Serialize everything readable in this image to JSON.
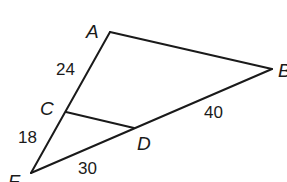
{
  "diagram": {
    "type": "geometry-triangle",
    "stroke_color": "#1a1a1a",
    "background": "#ffffff",
    "vertices": {
      "A": {
        "label": "A",
        "x": 110,
        "y": 32
      },
      "B": {
        "label": "B",
        "x": 272,
        "y": 69
      },
      "C": {
        "label": "C",
        "x": 66,
        "y": 112
      },
      "D": {
        "label": "D",
        "x": 134,
        "y": 128
      },
      "F": {
        "label": "F",
        "x": 31,
        "y": 173
      }
    },
    "segments": [
      {
        "from": "A",
        "to": "B"
      },
      {
        "from": "A",
        "to": "F"
      },
      {
        "from": "F",
        "to": "B"
      },
      {
        "from": "C",
        "to": "D"
      }
    ],
    "lengths": {
      "AC": "24",
      "CF": "18",
      "FD": "30",
      "DB": "40"
    }
  }
}
